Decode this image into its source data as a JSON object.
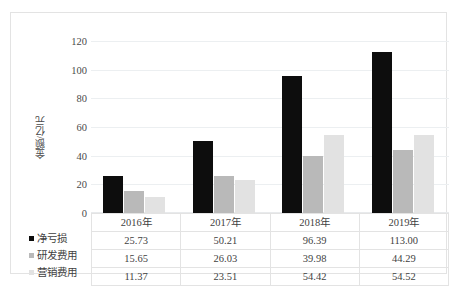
{
  "chart_data": {
    "type": "bar",
    "title": "",
    "xlabel": "",
    "ylabel": "金额/亿元",
    "ylim": [
      0,
      120
    ],
    "yticks": [
      0,
      20,
      40,
      60,
      80,
      100,
      120
    ],
    "grid": true,
    "legend_position": "left-table",
    "categories": [
      "2016年",
      "2017年",
      "2018年",
      "2019年"
    ],
    "series": [
      {
        "name": "净亏损",
        "color": "#0d0d0d",
        "values": [
          25.73,
          50.21,
          96.39,
          113.0
        ],
        "labels": [
          "25.73",
          "50.21",
          "96.39",
          "113.00"
        ]
      },
      {
        "name": "研发费用",
        "color": "#b9b9b9",
        "values": [
          15.65,
          26.03,
          39.98,
          44.29
        ],
        "labels": [
          "15.65",
          "26.03",
          "39.98",
          "44.29"
        ]
      },
      {
        "name": "营销费用",
        "color": "#e2e2e2",
        "values": [
          11.37,
          23.51,
          54.42,
          54.52
        ],
        "labels": [
          "11.37",
          "23.51",
          "54.42",
          "54.52"
        ]
      }
    ]
  },
  "axis": {
    "y_title": "金额/亿元",
    "tick_120": "120",
    "tick_100": "100",
    "tick_80": "80",
    "tick_60": "60",
    "tick_40": "40",
    "tick_20": "20",
    "tick_0": "0"
  },
  "table": {
    "header": [
      "2016年",
      "2017年",
      "2018年",
      "2019年"
    ],
    "rows": [
      {
        "name": "净亏损",
        "cells": [
          "25.73",
          "50.21",
          "96.39",
          "113.00"
        ]
      },
      {
        "name": "研发费用",
        "cells": [
          "15.65",
          "26.03",
          "39.98",
          "44.29"
        ]
      },
      {
        "name": "营销费用",
        "cells": [
          "11.37",
          "23.51",
          "54.42",
          "54.52"
        ]
      }
    ]
  }
}
